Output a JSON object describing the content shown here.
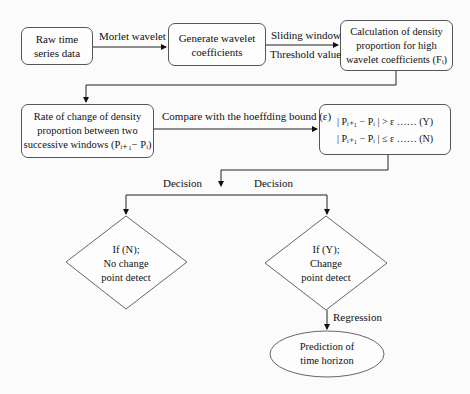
{
  "diagram": {
    "nodes": {
      "raw": {
        "lines": [
          "Raw time",
          "series data"
        ]
      },
      "generate": {
        "lines": [
          "Generate wavelet",
          "coefficients"
        ]
      },
      "calc": {
        "lines": [
          "Calculation of density",
          "proportion for high",
          "wavelet coefficients (Fᵢ)"
        ]
      },
      "rate": {
        "lines": [
          "Rate of change of density",
          "proportion between two",
          "successive windows (Pᵢ₊₁− Pᵢ)"
        ]
      },
      "compare": {
        "lines": [
          "| Pᵢ₊₁ − Pᵢ | > ε  …… (Y)",
          "| Pᵢ₊₁ − Pᵢ | ≤ ε  …… (N)"
        ]
      },
      "no_change": {
        "lines": [
          "If (N);",
          "No change",
          "point detect"
        ]
      },
      "change": {
        "lines": [
          "If (Y);",
          "Change",
          "point detect"
        ]
      },
      "prediction": {
        "lines": [
          "Prediction of",
          "time horizon"
        ]
      }
    },
    "edges": {
      "morlet": "Morlet wavelet",
      "sliding": "Sliding window",
      "threshold": "Threshold value",
      "compare": "Compare with the hoeffding bound (ε)",
      "decision_left": "Decision",
      "decision_right": "Decision",
      "regression": "Regression"
    }
  }
}
